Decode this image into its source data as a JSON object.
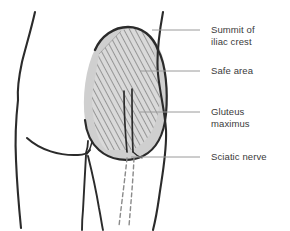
{
  "figure": {
    "kind": "anatomical-diagram",
    "view": "posterior view of pelvis and buttocks"
  },
  "colors": {
    "outline": "#2b2b2b",
    "muscle_fill": "#cfcfcf",
    "safe_area_fill": "#d9d9d9",
    "hatch_stroke": "#6f6f6f",
    "leader_line": "#9a9a9a",
    "label_text": "#3a3a3a",
    "nerve": "#2b2b2b",
    "background": "#ffffff"
  },
  "labels": [
    {
      "id": "summit",
      "text": "Summit of\niliac crest",
      "leader": {
        "x1": 200,
        "y1": 30,
        "x2": 152,
        "y2": 30
      }
    },
    {
      "id": "safe_area",
      "text": "Safe area",
      "leader": {
        "x1": 200,
        "y1": 71,
        "x2": 140,
        "y2": 71
      }
    },
    {
      "id": "gluteus",
      "text": "Gluteus\nmaximus",
      "leader": {
        "x1": 200,
        "y1": 112,
        "x2": 140,
        "y2": 112
      }
    },
    {
      "id": "sciatic",
      "text": "Sciatic nerve",
      "leader": {
        "x1": 200,
        "y1": 157,
        "x2": 131,
        "y2": 157
      }
    }
  ],
  "features": {
    "iliac_crest": "dark curved ridge across top of buttock",
    "safe_area": "diagonally hatched quadrilateral over upper-outer buttock",
    "gluteus_maximus": "light gray rounded buttock mass",
    "sciatic_nerve": "two solid lines descending through buttock continuing as dashed lines down the thigh",
    "gluteal_fold": "curved line beneath the buttocks",
    "natal_cleft": "short vertical line at midline"
  }
}
